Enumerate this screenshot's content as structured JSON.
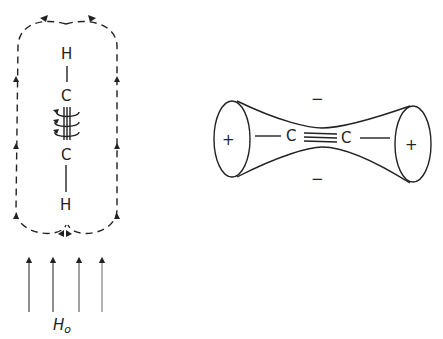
{
  "left_diagram": {
    "description": "Acetylene H-C≡C-H in magnetic field; induced ring current and induced field lines",
    "atoms": {
      "top_h": "H",
      "top_c": "C",
      "bottom_c": "C",
      "bottom_h": "H"
    },
    "field_label": "H",
    "field_label_sub": "o"
  },
  "right_diagram": {
    "description": "Shielding cone of C≡C triple bond",
    "atoms": {
      "left_c": "C",
      "right_c": "C"
    },
    "signs": {
      "left": "+",
      "right": "+",
      "top": "−",
      "bottom": "−"
    }
  }
}
